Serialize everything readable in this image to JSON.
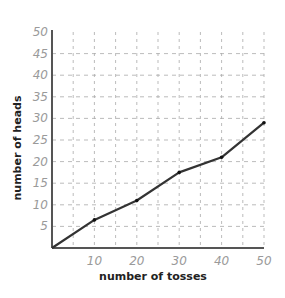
{
  "chart_data": {
    "type": "line",
    "title": "",
    "xlabel": "number of tosses",
    "ylabel": "number of heads",
    "xlim": [
      0,
      50
    ],
    "ylim": [
      0,
      50
    ],
    "x_ticks": [
      10,
      20,
      30,
      40,
      50
    ],
    "y_ticks": [
      5,
      10,
      15,
      20,
      25,
      30,
      35,
      40,
      45,
      50
    ],
    "grid": true,
    "grid_style": "dashed",
    "legend": null,
    "series": [
      {
        "name": "heads",
        "x": [
          0,
          10,
          20,
          30,
          40,
          50
        ],
        "values": [
          0,
          6.5,
          11,
          17.5,
          21,
          29
        ],
        "color": "#333333"
      }
    ]
  },
  "colors": {
    "line": "#333333",
    "axis": "#555555",
    "grid": "#aaaaaa",
    "tick_text": "#9a9a9a",
    "label_text": "#222222"
  }
}
